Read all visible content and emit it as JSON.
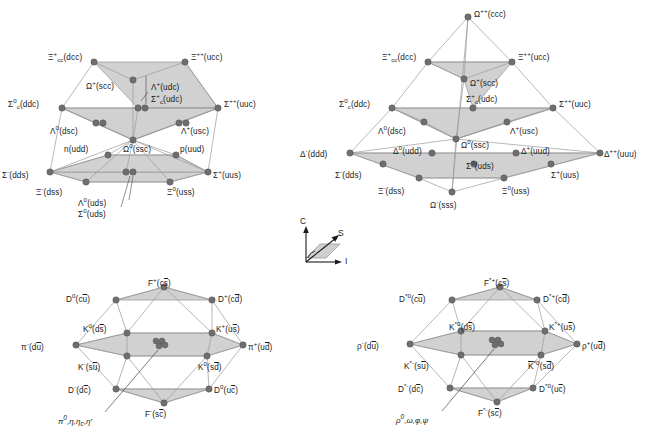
{
  "figure": {
    "background": "#ffffff",
    "node_color": "#6e6e6e",
    "face_color": "#cfcfcf",
    "edge_color": "#9a9a9a"
  },
  "axes_legend": {
    "name": "coordinate-axes",
    "c_label": "C",
    "s_label": "S",
    "i_label": "I"
  },
  "panels": [
    {
      "id": "baryon-20plet-octet",
      "name": "baryon-20-plet-with-octet",
      "nodes": [
        {
          "id": "Xi_cc_p",
          "label": "Ξ",
          "sup": "+",
          "sub": "cc",
          "content": "(dcc)",
          "x": 94,
          "y": 62,
          "lx": 52,
          "ly": 55,
          "anchor": "right"
        },
        {
          "id": "Xi_pp",
          "label": "Ξ",
          "sup": "++",
          "sub": "",
          "content": "(ucc)",
          "x": 185,
          "y": 62,
          "lx": 192,
          "ly": 55,
          "anchor": "left"
        },
        {
          "id": "Om_scc",
          "label": "Ω",
          "sup": "+",
          "sub": "",
          "content": "(scc)",
          "x": 133,
          "y": 80,
          "lx": 90,
          "ly": 84,
          "anchor": "right"
        },
        {
          "id": "Sig_c_ddc",
          "label": "Σ",
          "sup": "0",
          "sub": "c",
          "content": "(ddc)",
          "x": 62,
          "y": 108,
          "lx": 14,
          "ly": 101,
          "anchor": "right"
        },
        {
          "id": "Sig_uuc",
          "label": "Σ",
          "sup": "++",
          "sub": "",
          "content": "(uuc)",
          "x": 218,
          "y": 108,
          "lx": 225,
          "ly": 101,
          "anchor": "left"
        },
        {
          "id": "Lam_udc",
          "label": "Λ",
          "sup": "+",
          "sub": "",
          "content": "(udc)",
          "x": 138,
          "y": 108,
          "lx": 150,
          "ly": 85,
          "anchor": "left"
        },
        {
          "id": "Sig_c_udc",
          "label": "Σ",
          "sup": "+",
          "sub": "c",
          "content": "(udc)",
          "x": 144,
          "y": 108,
          "lx": 150,
          "ly": 96,
          "anchor": "left"
        },
        {
          "id": "Lam_dsc",
          "label": "Λ",
          "sup": "0",
          "sub": "",
          "content": "(dsc)",
          "x": 96,
          "y": 123,
          "lx": 55,
          "ly": 128,
          "anchor": "right"
        },
        {
          "id": "Sig_dsc",
          "label": "",
          "sup": "",
          "sub": "",
          "content": "",
          "x": 102,
          "y": 123,
          "lx": 0,
          "ly": 0,
          "anchor": "none"
        },
        {
          "id": "Lam_usc",
          "label": "A",
          "sup": "+",
          "sub": "",
          "content": "(usc)",
          "x": 180,
          "y": 123,
          "lx": 181,
          "ly": 128,
          "anchor": "left"
        },
        {
          "id": "Sig_usc",
          "label": "",
          "sup": "",
          "sub": "",
          "content": "",
          "x": 186,
          "y": 123,
          "lx": 0,
          "ly": 0,
          "anchor": "none"
        },
        {
          "id": "Om_ssc",
          "label": "Ω",
          "sup": "0",
          "sub": "",
          "content": "(ssc)",
          "x": 133,
          "y": 140,
          "lx": 124,
          "ly": 145,
          "anchor": "left"
        },
        {
          "id": "n_udd",
          "label": "n",
          "sup": "",
          "sub": "",
          "content": "(udd)",
          "x": 108,
          "y": 155,
          "lx": 68,
          "ly": 148,
          "anchor": "right"
        },
        {
          "id": "p_uud",
          "label": "p",
          "sup": "",
          "sub": "",
          "content": "(uud)",
          "x": 176,
          "y": 155,
          "lx": 180,
          "ly": 148,
          "anchor": "left"
        },
        {
          "id": "Sig_dds",
          "label": "Σ",
          "sup": "-",
          "sub": "",
          "content": "(dds)",
          "x": 50,
          "y": 172,
          "lx": 4,
          "ly": 172,
          "anchor": "right"
        },
        {
          "id": "Sig_uus",
          "label": "Σ",
          "sup": "+",
          "sub": "",
          "content": "(uus)",
          "x": 208,
          "y": 172,
          "lx": 213,
          "ly": 172,
          "anchor": "left"
        },
        {
          "id": "Xi_dss",
          "label": "Ξ",
          "sup": "-",
          "sub": "",
          "content": "(dss)",
          "x": 86,
          "y": 182,
          "lx": 40,
          "ly": 188,
          "anchor": "right"
        },
        {
          "id": "Xi_uss",
          "label": "Ξ",
          "sup": "0",
          "sub": "",
          "content": "(uss)",
          "x": 170,
          "y": 182,
          "lx": 170,
          "ly": 188,
          "anchor": "left"
        },
        {
          "id": "Lam_uds",
          "label": "Λ",
          "sup": "0",
          "sub": "",
          "content": "(uds)",
          "x": 126,
          "y": 172,
          "lx": 80,
          "ly": 196,
          "anchor": "right"
        },
        {
          "id": "Sig_uds",
          "label": "Σ",
          "sup": "0",
          "sub": "",
          "content": "(uds)",
          "x": 133,
          "y": 172,
          "lx": 80,
          "ly": 207,
          "anchor": "right"
        }
      ]
    },
    {
      "id": "baryon-decuplet",
      "name": "baryon-20-plet-decuplet",
      "nodes": [
        {
          "id": "Om_ccc",
          "label": "Ω",
          "sup": "++",
          "sub": "",
          "content": "(ccc)",
          "x": 468,
          "y": 17,
          "lx": 475,
          "ly": 10,
          "anchor": "left"
        },
        {
          "id": "Xi_cc_dcc",
          "label": "Ξ",
          "sup": "+",
          "sub": "cc",
          "content": "(dcc)",
          "x": 428,
          "y": 62,
          "lx": 386,
          "ly": 55,
          "anchor": "right"
        },
        {
          "id": "Xi_ucc",
          "label": "Ξ",
          "sup": "++",
          "sub": "",
          "content": "(ucc)",
          "x": 512,
          "y": 62,
          "lx": 519,
          "ly": 55,
          "anchor": "left"
        },
        {
          "id": "Om_scc2",
          "label": "Ω",
          "sup": "+",
          "sub": "",
          "content": "(scc)",
          "x": 464,
          "y": 79,
          "lx": 469,
          "ly": 80,
          "anchor": "left"
        },
        {
          "id": "Sig_ddc2",
          "label": "Σ",
          "sup": "0",
          "sub": "c",
          "content": "(ddc)",
          "x": 392,
          "y": 108,
          "lx": 345,
          "ly": 101,
          "anchor": "right"
        },
        {
          "id": "Sig_udc2",
          "label": "Σ",
          "sup": "+",
          "sub": "c",
          "content": "(udc)",
          "x": 473,
          "y": 108,
          "lx": 470,
          "ly": 96,
          "anchor": "left"
        },
        {
          "id": "Sig_uuc2",
          "label": "Σ",
          "sup": "++",
          "sub": "",
          "content": "(uuc)",
          "x": 553,
          "y": 108,
          "lx": 559,
          "ly": 101,
          "anchor": "left"
        },
        {
          "id": "Lam_dsc2",
          "label": "A",
          "sup": "0",
          "sub": "",
          "content": "(dsc)",
          "x": 424,
          "y": 122,
          "lx": 383,
          "ly": 128,
          "anchor": "right"
        },
        {
          "id": "Lam_usc2",
          "label": "A",
          "sup": "+",
          "sub": "",
          "content": "(usc)",
          "x": 507,
          "y": 122,
          "lx": 510,
          "ly": 128,
          "anchor": "left"
        },
        {
          "id": "Om_ssc2",
          "label": "Ω",
          "sup": "0",
          "sub": "",
          "content": "(ssc)",
          "x": 456,
          "y": 139,
          "lx": 461,
          "ly": 141,
          "anchor": "left"
        },
        {
          "id": "Del_ddd",
          "label": "Δ",
          "sup": "-",
          "sub": "",
          "content": "(ddd)",
          "x": 350,
          "y": 153,
          "lx": 304,
          "ly": 147,
          "anchor": "right"
        },
        {
          "id": "Del_udd",
          "label": "Δ",
          "sup": "0",
          "sub": "",
          "content": "(udd)",
          "x": 432,
          "y": 153,
          "lx": 395,
          "ly": 146,
          "anchor": "right"
        },
        {
          "id": "Del_uud",
          "label": "Δ",
          "sup": "+",
          "sub": "",
          "content": "(uud)",
          "x": 516,
          "y": 153,
          "lx": 520,
          "ly": 146,
          "anchor": "left"
        },
        {
          "id": "Del_uuu",
          "label": "Δ",
          "sup": "++",
          "sub": "",
          "content": "(uuu)",
          "x": 600,
          "y": 153,
          "lx": 605,
          "ly": 147,
          "anchor": "left"
        },
        {
          "id": "Sig_dds2",
          "label": "Σ",
          "sup": "-",
          "sub": "",
          "content": "(dds)",
          "x": 383,
          "y": 164,
          "lx": 337,
          "ly": 170,
          "anchor": "right"
        },
        {
          "id": "Sig_uds2",
          "label": "Σ",
          "sup": "0",
          "sub": "",
          "content": "(uds)",
          "x": 474,
          "y": 164,
          "lx": 470,
          "ly": 160,
          "anchor": "left"
        },
        {
          "id": "Sig_uus2",
          "label": "Σ",
          "sup": "+",
          "sub": "",
          "content": "(uus)",
          "x": 551,
          "y": 164,
          "lx": 553,
          "ly": 170,
          "anchor": "left"
        },
        {
          "id": "Xi_dss2",
          "label": "Ξ",
          "sup": "-",
          "sub": "",
          "content": "(dss)",
          "x": 419,
          "y": 178,
          "lx": 381,
          "ly": 184,
          "anchor": "right"
        },
        {
          "id": "Xi_uss2",
          "label": "Ξ",
          "sup": "0",
          "sub": "",
          "content": "(uss)",
          "x": 504,
          "y": 178,
          "lx": 504,
          "ly": 184,
          "anchor": "left"
        },
        {
          "id": "Om_sss",
          "label": "Ω",
          "sup": "-",
          "sub": "",
          "content": "(sss)",
          "x": 452,
          "y": 192,
          "lx": 433,
          "ly": 197,
          "anchor": "left"
        }
      ]
    },
    {
      "id": "pseudoscalar-mesons",
      "name": "pseudoscalar-meson-16-plet",
      "nodes": [
        {
          "id": "F_cs",
          "label": "F",
          "sup": "+",
          "sub": "",
          "content": "(c",
          "ovl": "s",
          "tail": ")",
          "x": 164,
          "y": 287,
          "lx": 150,
          "ly": 277,
          "anchor": "left"
        },
        {
          "id": "D0_cu",
          "label": "D",
          "sup": "0",
          "sub": "",
          "content": "(c",
          "ovl": "u",
          "tail": ")",
          "x": 116,
          "y": 300,
          "lx": 72,
          "ly": 294,
          "anchor": "right"
        },
        {
          "id": "Dp_cd",
          "label": "D",
          "sup": "+",
          "sub": "",
          "content": "(c",
          "ovl": "d",
          "tail": ")",
          "x": 212,
          "y": 300,
          "lx": 218,
          "ly": 294,
          "anchor": "left"
        },
        {
          "id": "K0_ds",
          "label": "K",
          "sup": "0",
          "sub": "",
          "content": "(d",
          "ovl": "s",
          "tail": ")",
          "x": 127,
          "y": 333,
          "lx": 87,
          "ly": 323,
          "anchor": "right"
        },
        {
          "id": "Kp_us",
          "label": "K",
          "sup": "+",
          "sub": "",
          "content": "(u",
          "ovl": "s",
          "tail": ")",
          "x": 212,
          "y": 333,
          "lx": 216,
          "ly": 323,
          "anchor": "left"
        },
        {
          "id": "pi_m",
          "label": "π",
          "sup": "-",
          "sub": "",
          "content": "(d",
          "ovl": "u",
          "tail": ")",
          "x": 76,
          "y": 345,
          "lx": 28,
          "ly": 340,
          "anchor": "right"
        },
        {
          "id": "pi_p",
          "label": "π",
          "sup": "+",
          "sub": "",
          "content": "(u",
          "ovl": "d",
          "tail": ")",
          "x": 243,
          "y": 345,
          "lx": 248,
          "ly": 340,
          "anchor": "left"
        },
        {
          "id": "Km_su",
          "label": "K",
          "sup": "-",
          "sub": "",
          "content": "(s",
          "ovl": "u",
          "tail": ")",
          "x": 127,
          "y": 356,
          "lx": 82,
          "ly": 362,
          "anchor": "right"
        },
        {
          "id": "K0b_sd",
          "label": "K",
          "sup": "0",
          "sub": "",
          "content": "(s",
          "ovl": "d",
          "tail": ")",
          "x": 207,
          "y": 356,
          "lx": 205,
          "ly": 362,
          "anchor": "left"
        },
        {
          "id": "Dm_dc",
          "label": "D",
          "sup": "-",
          "sub": "",
          "content": "(d",
          "ovl": "c",
          "tail": ")",
          "x": 116,
          "y": 389,
          "lx": 73,
          "ly": 386,
          "anchor": "right"
        },
        {
          "id": "D0b_uc",
          "label": "D",
          "sup": "0",
          "sub": "",
          "content": "(u",
          "ovl": "c",
          "tail": ")",
          "x": 209,
          "y": 389,
          "lx": 214,
          "ly": 386,
          "anchor": "left"
        },
        {
          "id": "F_sc",
          "label": "F",
          "sup": "-",
          "sub": "",
          "content": "(s",
          "ovl": "c",
          "tail": ")",
          "x": 164,
          "y": 403,
          "lx": 148,
          "ly": 409,
          "anchor": "left"
        }
      ],
      "center_multiplet": {
        "x": 159,
        "y": 343,
        "annotation": "π⁰, η, ηc, η′",
        "ax": 66,
        "ay": 417
      },
      "center_label": "d̄d"
    },
    {
      "id": "vector-mesons",
      "name": "vector-meson-16-plet",
      "nodes": [
        {
          "id": "Fs_cs",
          "label": "F",
          "sup": "*+",
          "sub": "",
          "content": "(c",
          "ovl": "s",
          "tail": ")",
          "x": 500,
          "y": 287,
          "lx": 486,
          "ly": 277,
          "anchor": "left"
        },
        {
          "id": "Ds0_cu",
          "label": "D",
          "sup": "*0",
          "sub": "",
          "content": "(c",
          "ovl": "u",
          "tail": ")",
          "x": 452,
          "y": 300,
          "lx": 405,
          "ly": 294,
          "anchor": "right"
        },
        {
          "id": "Dsp_cd",
          "label": "D",
          "sup": "*+",
          "sub": "",
          "content": "(c",
          "ovl": "d",
          "tail": ")",
          "x": 537,
          "y": 300,
          "lx": 543,
          "ly": 294,
          "anchor": "left"
        },
        {
          "id": "Ks0_ds",
          "label": "K",
          "sup": "*0",
          "sub": "",
          "content": "(d",
          "ovl": "s",
          "tail": ")",
          "x": 461,
          "y": 331,
          "lx": 453,
          "ly": 322,
          "anchor": "left"
        },
        {
          "id": "Ksp_us",
          "label": "K",
          "sup": "*+",
          "sub": "",
          "content": "(u",
          "ovl": "s",
          "tail": ")",
          "x": 545,
          "y": 331,
          "lx": 550,
          "ly": 322,
          "anchor": "left"
        },
        {
          "id": "rho_m",
          "label": "ρ",
          "sup": "-",
          "sub": "",
          "content": "(d",
          "ovl": "u",
          "tail": ")",
          "x": 410,
          "y": 344,
          "lx": 363,
          "ly": 339,
          "anchor": "right"
        },
        {
          "id": "rho_p",
          "label": "ρ",
          "sup": "+",
          "sub": "",
          "content": "(u",
          "ovl": "d",
          "tail": ")",
          "x": 577,
          "y": 344,
          "lx": 582,
          "ly": 339,
          "anchor": "left"
        },
        {
          "id": "Ksm_su",
          "label": "K",
          "sup": "*-",
          "sub": "",
          "content": "(s",
          "ovl": "u",
          "tail": ")",
          "x": 461,
          "y": 355,
          "lx": 410,
          "ly": 361,
          "anchor": "right"
        },
        {
          "id": "Ks0b_sd",
          "label": "K",
          "sup": "*0",
          "sub": "",
          "content": "(s",
          "ovl": "d",
          "tail": ")",
          "x": 541,
          "y": 355,
          "lx": 536,
          "ly": 361,
          "anchor": "left"
        },
        {
          "id": "Dsm_dc",
          "label": "D",
          "sup": "*-",
          "sub": "",
          "content": "(d",
          "ovl": "c",
          "tail": ")",
          "x": 450,
          "y": 388,
          "lx": 402,
          "ly": 385,
          "anchor": "right"
        },
        {
          "id": "Ds0b_uc",
          "label": "D",
          "sup": "*0",
          "sub": "",
          "content": "(u",
          "ovl": "c",
          "tail": ")",
          "x": 533,
          "y": 388,
          "lx": 539,
          "ly": 385,
          "anchor": "left"
        },
        {
          "id": "Fs_sc",
          "label": "F",
          "sup": "*-",
          "sub": "",
          "content": "(s",
          "ovl": "c",
          "tail": ")",
          "x": 497,
          "y": 402,
          "lx": 480,
          "ly": 408,
          "anchor": "left"
        }
      ],
      "center_multiplet": {
        "x": 495,
        "y": 342,
        "annotation": "ρ⁰, ω, φ, ψ",
        "ax": 403,
        "ay": 416
      },
      "center_label": "d̄d"
    }
  ]
}
